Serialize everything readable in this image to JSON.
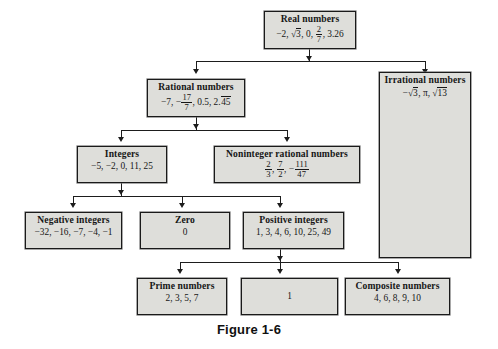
{
  "figure": {
    "caption": "Figure 1-6",
    "colors": {
      "box_fill": "#dededa",
      "box_border": "#1a1a1a",
      "connector": "#1d1d1d",
      "page_background": "#ffffff"
    }
  },
  "nodes": {
    "real_numbers": {
      "title": "Real numbers",
      "items_text": "−2, −√3, 0, 2/7, 3.26"
    },
    "rational": {
      "title": "Rational numbers",
      "items_text": "−7, −17/7, 0.5, 2.45̅"
    },
    "irrational": {
      "title": "Irrational numbers",
      "items_text": "−√3, π, √13"
    },
    "integers": {
      "title": "Integers",
      "items_text": "−5, −2, 0, 11, 25"
    },
    "noninteger": {
      "title": "Noninteger rational numbers",
      "items_text": "2/3, 7/2, −111/47"
    },
    "negative_int": {
      "title": "Negative integers",
      "items_text": "−32, −16, −7, −4, −1"
    },
    "zero": {
      "title": "Zero",
      "items_text": "0"
    },
    "positive_int": {
      "title": "Positive integers",
      "items_text": "1, 3, 4, 6, 10, 25, 49"
    },
    "prime": {
      "title": "Prime numbers",
      "items_text": "2, 3, 5, 7"
    },
    "one": {
      "title": "",
      "items_text": "1"
    },
    "composite": {
      "title": "Composite numbers",
      "items_text": "4, 6, 8, 9, 10"
    }
  },
  "parts": {
    "minus": "−",
    "comma": ", ",
    "pi": "π",
    "radical": "√",
    "real_v1": "−2, ",
    "real_v2_rad": "3",
    "real_v3": ", 0, ",
    "real_frac_num": "2",
    "real_frac_den": "7",
    "real_v4": ", 3.26",
    "rational_v1": "−7, −",
    "rational_frac_num": "17",
    "rational_frac_den": "7",
    "rational_v2": ", 0.5, 2.",
    "rational_repeat": "45",
    "irr_v1": ", ",
    "irr_rad1": "3",
    "irr_rad2": "13",
    "nonint_f1_num": "2",
    "nonint_f1_den": "3",
    "nonint_f2_num": "7",
    "nonint_f2_den": "2",
    "nonint_f3_num": "111",
    "nonint_f3_den": "47"
  }
}
